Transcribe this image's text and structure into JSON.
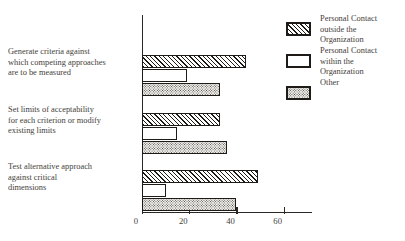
{
  "chart_data": {
    "type": "bar",
    "orientation": "horizontal",
    "title": "",
    "xlabel": "",
    "ylabel": "",
    "xlim": [
      0,
      72
    ],
    "grid": false,
    "legend_position": "right",
    "xticks": [
      0,
      20,
      40,
      60
    ],
    "xticklabels": [
      "0",
      "20",
      "40",
      "60"
    ],
    "categories": [
      "Generate criteria against\nwhich competing approaches\nare to be measured",
      "Set limits of acceptability\nfor each criterion or modify\nexisting limits",
      "Test alternative approach\nagainst critical\ndimensions"
    ],
    "series": [
      {
        "name": "Personal Contact\noutside the\nOrganization",
        "pattern": "diagonal-hatch",
        "values": [
          44,
          33,
          49
        ]
      },
      {
        "name": "Personal Contact\nwithin the\nOrganization",
        "pattern": "solid-white",
        "values": [
          19,
          15,
          10
        ]
      },
      {
        "name": "Other",
        "pattern": "dotted",
        "values": [
          33,
          36,
          40
        ]
      }
    ]
  },
  "legend": {
    "items": [
      {
        "label": "Personal Contact\noutside the\nOrganization",
        "swatch": "hatch"
      },
      {
        "label": "Personal Contact\nwithin the\nOrganization",
        "swatch": "white"
      },
      {
        "label": "Other",
        "swatch": "dots"
      }
    ]
  },
  "colors": {
    "ink": "#1d1a18",
    "text": "#433e39",
    "background": "#ffffff",
    "dot_fill": "#efeeea"
  }
}
